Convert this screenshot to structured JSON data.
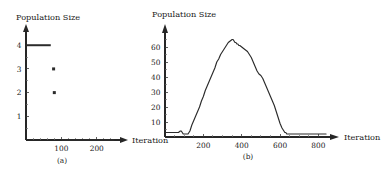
{
  "figure": {
    "background_color": "#ffffff",
    "ink_color": "#2b2b2b",
    "panels": [
      "a",
      "b"
    ]
  },
  "panel_a": {
    "caption": "(a)",
    "y_axis_title": "Population Size",
    "x_axis_title": "Iteration",
    "y_tick_labels": [
      "1",
      "2",
      "3",
      "4"
    ],
    "x_tick_labels": [
      "100",
      "200"
    ]
  },
  "panel_b": {
    "caption": "(b)",
    "y_axis_title": "Population Size",
    "x_axis_title": "Iteration",
    "y_tick_labels": [
      "10",
      "20",
      "30",
      "40",
      "50",
      "60"
    ],
    "x_tick_labels": [
      "200",
      "400",
      "600",
      "800"
    ]
  },
  "chart_data": [
    {
      "type": "line",
      "panel": "a",
      "title": "",
      "subtitle": "(a)",
      "xlabel": "Iteration",
      "ylabel": "Population Size",
      "xlim": [
        0,
        260
      ],
      "ylim": [
        0,
        4.6
      ],
      "grid": false,
      "legend": "none",
      "x_ticks": [
        100,
        200
      ],
      "y_ticks": [
        1,
        2,
        3,
        4
      ],
      "x_minor_ticks": [
        20,
        40,
        60,
        80,
        120,
        140,
        160,
        180,
        220,
        240
      ],
      "y_minor_ticks": [
        0.5,
        1.5,
        2.5,
        3.5
      ],
      "series": [
        {
          "name": "population size",
          "style": "thick-segment",
          "x": [
            0,
            5,
            10,
            15,
            20,
            25,
            30,
            35,
            40,
            45,
            50,
            55,
            60,
            65,
            70
          ],
          "values": [
            4,
            4,
            4,
            4,
            4,
            4,
            4,
            4,
            4,
            4,
            4,
            4,
            4,
            4,
            4
          ]
        },
        {
          "name": "isolated-markers",
          "style": "marker",
          "x": [
            78,
            80
          ],
          "values": [
            3,
            2
          ]
        },
        {
          "name": "extinct-tail",
          "style": "thick-segment",
          "x": [
            100,
            110,
            120,
            130,
            140,
            150,
            160,
            170,
            180,
            190,
            200,
            210,
            220,
            230,
            240,
            250
          ],
          "values": [
            0,
            0,
            0,
            0,
            0,
            0,
            0,
            0,
            0,
            0,
            0,
            0,
            0,
            0,
            0,
            0
          ]
        }
      ]
    },
    {
      "type": "line",
      "panel": "b",
      "title": "",
      "subtitle": "(b)",
      "xlabel": "Iteration",
      "ylabel": "Population Size",
      "xlim": [
        0,
        850
      ],
      "ylim": [
        0,
        70
      ],
      "grid": false,
      "legend": "none",
      "x_ticks": [
        200,
        400,
        600,
        800
      ],
      "y_ticks": [
        10,
        20,
        30,
        40,
        50,
        60
      ],
      "x_minor_ticks": [
        50,
        100,
        150,
        250,
        300,
        350,
        450,
        500,
        550,
        650,
        700,
        750
      ],
      "y_minor_ticks": [
        5,
        15,
        25,
        35,
        45,
        55,
        65
      ],
      "series": [
        {
          "name": "population size",
          "style": "line",
          "x": [
            0,
            10,
            20,
            30,
            40,
            50,
            60,
            70,
            80,
            85,
            90,
            95,
            100,
            105,
            110,
            115,
            120,
            125,
            130,
            135,
            140,
            150,
            160,
            170,
            180,
            190,
            200,
            210,
            220,
            230,
            240,
            250,
            260,
            270,
            280,
            290,
            300,
            310,
            320,
            330,
            340,
            350,
            355,
            360,
            365,
            370,
            375,
            380,
            385,
            390,
            400,
            410,
            420,
            430,
            440,
            450,
            460,
            470,
            480,
            490,
            500,
            510,
            520,
            530,
            540,
            550,
            560,
            570,
            580,
            590,
            600,
            610,
            615,
            620,
            625,
            630,
            635,
            640,
            650,
            660,
            680,
            700,
            720,
            740,
            760,
            780,
            800,
            820,
            840
          ],
          "values": [
            3,
            3,
            3,
            3,
            3,
            3,
            3,
            3,
            4,
            4,
            3,
            2,
            2,
            2,
            2,
            2,
            2,
            3,
            4,
            6,
            8,
            11,
            14,
            17,
            20,
            24,
            27,
            31,
            34,
            37,
            40,
            43,
            46,
            50,
            52,
            55,
            57,
            59,
            61,
            63,
            64,
            65,
            65,
            64,
            63,
            63,
            62,
            62,
            61,
            61,
            60,
            59,
            58,
            57,
            55,
            53,
            50,
            47,
            44,
            42,
            41,
            39,
            36,
            33,
            30,
            27,
            24,
            21,
            17,
            13,
            9,
            6,
            5,
            4,
            3,
            3,
            2,
            2,
            2,
            2,
            2,
            2,
            2,
            2,
            2,
            2,
            2,
            2,
            2
          ]
        }
      ]
    }
  ]
}
